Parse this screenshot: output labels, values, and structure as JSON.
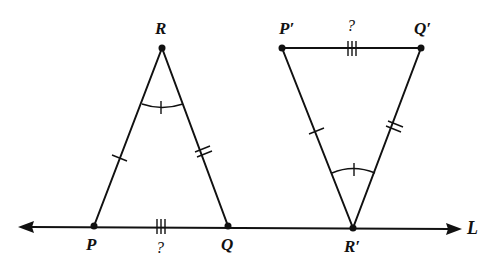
{
  "diagram": {
    "type": "geometry",
    "line": {
      "label": "L"
    },
    "triangle1": {
      "vertices": {
        "top": "R",
        "left": "P",
        "right": "Q"
      },
      "unknown_side_label": "?",
      "marks": {
        "RP": "single-tick",
        "RQ": "double-tick",
        "PQ": "triple-tick",
        "angle_R": "single-tick-arc"
      }
    },
    "triangle2": {
      "vertices": {
        "bottom": "R′",
        "left": "P′",
        "right": "Q′"
      },
      "unknown_side_label": "?",
      "marks": {
        "R'P'": "single-tick",
        "R'Q'": "double-tick",
        "P'Q'": "triple-tick",
        "angle_R'": "single-tick-arc"
      }
    }
  }
}
